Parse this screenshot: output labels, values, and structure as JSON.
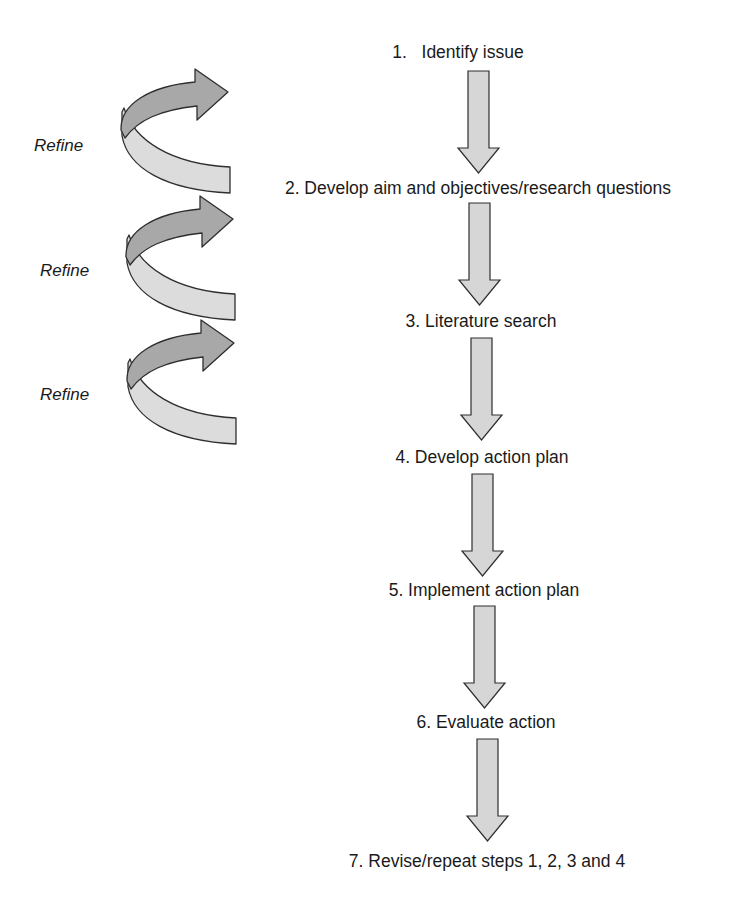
{
  "diagram": {
    "type": "process-flow",
    "colors": {
      "down_arrow_fill": "#d6d6d6",
      "spiral_dark_fill": "#a8a8a8",
      "spiral_light_fill": "#dcdcdc",
      "stroke": "#2e2e2e",
      "text": "#1a1a1a"
    },
    "steps": [
      {
        "number": "1.",
        "label": "1.   Identify issue"
      },
      {
        "number": "2.",
        "label": "2. Develop aim and objectives/research questions"
      },
      {
        "number": "3.",
        "label": "3. Literature search"
      },
      {
        "number": "4.",
        "label": "4. Develop action plan"
      },
      {
        "number": "5.",
        "label": "5. Implement action plan"
      },
      {
        "number": "6.",
        "label": "6. Evaluate action"
      },
      {
        "number": "7.",
        "label": "7. Revise/repeat steps 1, 2, 3 and 4"
      }
    ],
    "refine_loops": [
      {
        "label": "Refine"
      },
      {
        "label": "Refine"
      },
      {
        "label": "Refine"
      }
    ],
    "connectors": [
      {
        "from": 1,
        "to": 2,
        "icon": "down-arrow-icon"
      },
      {
        "from": 2,
        "to": 3,
        "icon": "down-arrow-icon"
      },
      {
        "from": 3,
        "to": 4,
        "icon": "down-arrow-icon"
      },
      {
        "from": 4,
        "to": 5,
        "icon": "down-arrow-icon"
      },
      {
        "from": 5,
        "to": 6,
        "icon": "down-arrow-icon"
      },
      {
        "from": 6,
        "to": 7,
        "icon": "down-arrow-icon"
      }
    ]
  }
}
